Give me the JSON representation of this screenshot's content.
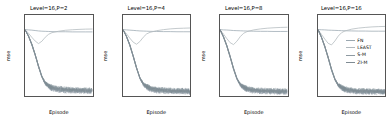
{
  "figure": {
    "xlabel": "Episode",
    "ylabel": "mse"
  },
  "legend": {
    "position": "center-right-panel4",
    "entries": [
      {
        "label": "FN",
        "color": "#9aa7b0"
      },
      {
        "label": "LEAST",
        "color": "#b0b8bd"
      },
      {
        "label": "S-M",
        "color": "#8e9aa2"
      },
      {
        "label": "ZI-M",
        "color": "#7f8b93"
      }
    ]
  },
  "axes": {
    "xticks": [
      0,
      2500,
      5000,
      7500,
      10000
    ],
    "xticklabels": [
      "0",
      "2500",
      "5000",
      "7500",
      "10000"
    ],
    "xlim": [
      0,
      10000
    ],
    "yticklabels": [
      "10",
      "10"
    ],
    "ytickexp": [
      "2",
      "1"
    ],
    "yticks": [
      100,
      10
    ],
    "ylim": [
      1.4,
      320
    ],
    "yscale": "log",
    "grid": false
  },
  "chart_data": [
    {
      "type": "line",
      "title": "Level=16,P=2",
      "xlabel": "Episode",
      "ylabel": "mse",
      "yscale": "log",
      "xlim": [
        0,
        10000
      ],
      "ylim": [
        1.4,
        320
      ],
      "x": [
        0,
        500,
        1000,
        1500,
        2000,
        2500,
        3000,
        3500,
        4000,
        5000,
        6000,
        7000,
        8000,
        9000,
        10000
      ],
      "series": [
        {
          "name": "FN",
          "values": [
            120,
            118,
            116,
            113,
            110,
            108,
            107,
            106,
            105,
            104,
            104,
            103,
            103,
            103,
            103
          ]
        },
        {
          "name": "LEAST",
          "values": [
            120,
            95,
            72,
            56,
            47,
            55,
            72,
            88,
            98,
            108,
            115,
            119,
            122,
            124,
            125
          ]
        },
        {
          "name": "S-M",
          "values": [
            120,
            78,
            44,
            22,
            10,
            5.0,
            3.2,
            2.6,
            2.3,
            2.1,
            2.0,
            2.0,
            1.95,
            1.95,
            1.9
          ]
        },
        {
          "name": "ZI-M",
          "values": [
            120,
            80,
            46,
            23,
            10.5,
            5.2,
            3.4,
            2.8,
            2.5,
            2.3,
            2.2,
            2.15,
            2.1,
            2.1,
            2.05
          ]
        }
      ]
    },
    {
      "type": "line",
      "title": "Level=16,P=4",
      "xlabel": "Episode",
      "ylabel": "mse",
      "yscale": "log",
      "xlim": [
        0,
        10000
      ],
      "ylim": [
        1.4,
        320
      ],
      "x": [
        0,
        500,
        1000,
        1500,
        2000,
        2500,
        3000,
        3500,
        4000,
        5000,
        6000,
        7000,
        8000,
        9000,
        10000
      ],
      "series": [
        {
          "name": "FN",
          "values": [
            120,
            118,
            116,
            114,
            112,
            110,
            109,
            108,
            107,
            106,
            105,
            105,
            104,
            104,
            104
          ]
        },
        {
          "name": "LEAST",
          "values": [
            120,
            92,
            68,
            52,
            45,
            54,
            72,
            90,
            100,
            112,
            120,
            126,
            130,
            132,
            134
          ]
        },
        {
          "name": "S-M",
          "values": [
            120,
            76,
            42,
            20,
            9.0,
            4.6,
            3.0,
            2.5,
            2.2,
            2.0,
            1.95,
            1.9,
            1.9,
            1.88,
            1.85
          ]
        },
        {
          "name": "ZI-M",
          "values": [
            120,
            78,
            44,
            21,
            9.5,
            4.8,
            3.2,
            2.7,
            2.4,
            2.2,
            2.1,
            2.05,
            2.0,
            2.0,
            1.98
          ]
        }
      ]
    },
    {
      "type": "line",
      "title": "Level=16,P=8",
      "xlabel": "Episode",
      "ylabel": "mse",
      "yscale": "log",
      "xlim": [
        0,
        10000
      ],
      "ylim": [
        1.4,
        320
      ],
      "x": [
        0,
        500,
        1000,
        1500,
        2000,
        2500,
        3000,
        3500,
        4000,
        5000,
        6000,
        7000,
        8000,
        9000,
        10000
      ],
      "series": [
        {
          "name": "FN",
          "values": [
            120,
            118,
            117,
            115,
            113,
            112,
            111,
            110,
            109,
            108,
            107,
            107,
            106,
            106,
            106
          ]
        },
        {
          "name": "LEAST",
          "values": [
            120,
            90,
            66,
            50,
            44,
            55,
            75,
            94,
            105,
            118,
            126,
            132,
            136,
            139,
            141
          ]
        },
        {
          "name": "S-M",
          "values": [
            120,
            74,
            40,
            19,
            8.5,
            4.4,
            2.9,
            2.4,
            2.15,
            1.95,
            1.9,
            1.88,
            1.85,
            1.85,
            1.82
          ]
        },
        {
          "name": "ZI-M",
          "values": [
            120,
            76,
            42,
            20,
            9.0,
            4.6,
            3.1,
            2.6,
            2.3,
            2.1,
            2.05,
            2.0,
            1.98,
            1.95,
            1.95
          ]
        }
      ]
    },
    {
      "type": "line",
      "title": "Level=16,P=16",
      "xlabel": "Episode",
      "ylabel": "mse",
      "yscale": "log",
      "xlim": [
        0,
        10000
      ],
      "ylim": [
        1.4,
        320
      ],
      "x": [
        0,
        500,
        1000,
        1500,
        2000,
        2500,
        3000,
        3500,
        4000,
        5000,
        6000,
        7000,
        8000,
        9000,
        10000
      ],
      "series": [
        {
          "name": "FN",
          "values": [
            120,
            119,
            118,
            116,
            115,
            114,
            113,
            112,
            111,
            110,
            109,
            109,
            108,
            108,
            108
          ]
        },
        {
          "name": "LEAST",
          "values": [
            120,
            88,
            64,
            48,
            43,
            56,
            78,
            98,
            110,
            124,
            133,
            139,
            144,
            147,
            149
          ]
        },
        {
          "name": "S-M",
          "values": [
            120,
            72,
            38,
            18,
            8.0,
            4.2,
            2.8,
            2.35,
            2.1,
            1.92,
            1.88,
            1.85,
            1.82,
            1.8,
            1.8
          ]
        },
        {
          "name": "ZI-M",
          "values": [
            120,
            74,
            40,
            19,
            8.5,
            4.4,
            3.0,
            2.55,
            2.25,
            2.05,
            2.0,
            1.98,
            1.95,
            1.92,
            1.9
          ]
        }
      ]
    }
  ]
}
